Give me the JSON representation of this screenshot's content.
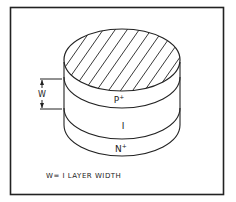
{
  "figure": {
    "layers": [
      {
        "id": "p",
        "label": "P",
        "superscript": "+"
      },
      {
        "id": "i",
        "label": "I",
        "superscript": ""
      },
      {
        "id": "n",
        "label": "N",
        "superscript": "+"
      }
    ],
    "dimension": {
      "label": "W"
    },
    "caption": "W= I LAYER WIDTH",
    "colors": {
      "line": "#222222",
      "background": "#ffffff"
    }
  }
}
